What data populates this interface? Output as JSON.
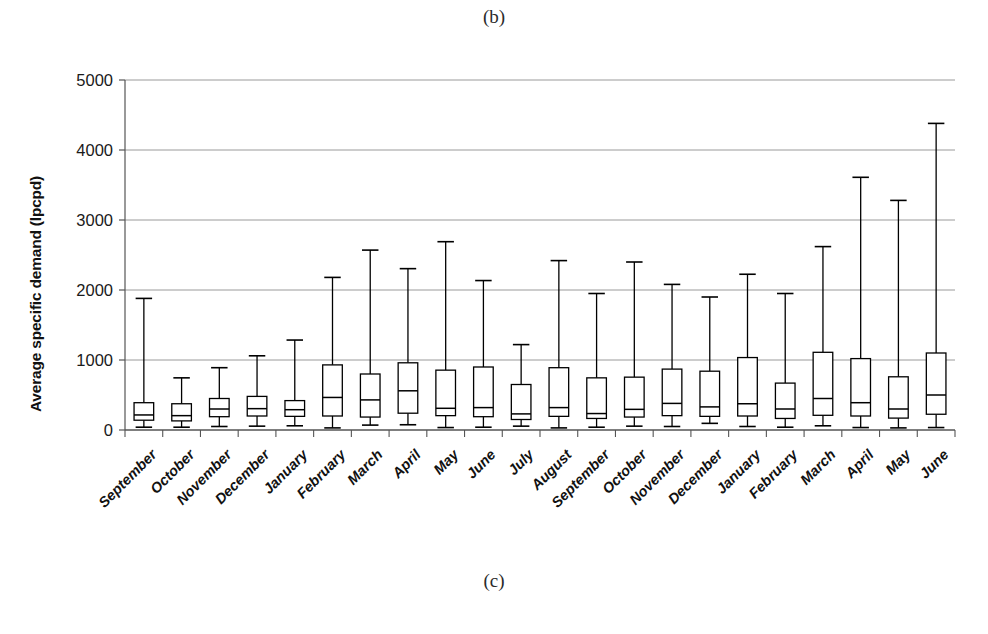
{
  "figure": {
    "caption_top": "(b)",
    "caption_bottom": "(c)"
  },
  "chart_data": {
    "type": "box",
    "title": "",
    "subtitle": "",
    "xlabel": "",
    "ylabel": "Average specific demand (lpcpd)",
    "ylim": [
      0,
      5000
    ],
    "ytick_labels": [
      "0",
      "1000",
      "2000",
      "3000",
      "4000",
      "5000"
    ],
    "yticks": [
      0,
      1000,
      2000,
      3000,
      4000,
      5000
    ],
    "grid": "horizontal",
    "legend": "none",
    "units": "lpcpd",
    "box_fill": "#ffffff",
    "box_stroke": "#000000",
    "grid_color": "#9a9a9a",
    "categories": [
      "September",
      "October",
      "November",
      "December",
      "January",
      "February",
      "March",
      "April",
      "May",
      "June",
      "July",
      "August",
      "September",
      "October",
      "November",
      "December",
      "January",
      "February",
      "March",
      "April",
      "May",
      "June"
    ],
    "boxes": [
      {
        "category": "September",
        "min": 40,
        "q1": 140,
        "median": 215,
        "q3": 390,
        "max": 1880
      },
      {
        "category": "October",
        "min": 40,
        "q1": 130,
        "median": 205,
        "q3": 375,
        "max": 745
      },
      {
        "category": "November",
        "min": 50,
        "q1": 190,
        "median": 300,
        "q3": 450,
        "max": 890
      },
      {
        "category": "December",
        "min": 55,
        "q1": 200,
        "median": 305,
        "q3": 480,
        "max": 1060
      },
      {
        "category": "January",
        "min": 60,
        "q1": 195,
        "median": 290,
        "q3": 420,
        "max": 1285
      },
      {
        "category": "February",
        "min": 30,
        "q1": 200,
        "median": 465,
        "q3": 930,
        "max": 2180
      },
      {
        "category": "March",
        "min": 70,
        "q1": 185,
        "median": 430,
        "q3": 800,
        "max": 2570
      },
      {
        "category": "April",
        "min": 75,
        "q1": 240,
        "median": 560,
        "q3": 960,
        "max": 2305
      },
      {
        "category": "May",
        "min": 35,
        "q1": 205,
        "median": 310,
        "q3": 855,
        "max": 2690
      },
      {
        "category": "June",
        "min": 40,
        "q1": 190,
        "median": 320,
        "q3": 900,
        "max": 2135
      },
      {
        "category": "July",
        "min": 55,
        "q1": 150,
        "median": 230,
        "q3": 650,
        "max": 1220
      },
      {
        "category": "August",
        "min": 30,
        "q1": 195,
        "median": 320,
        "q3": 890,
        "max": 2420
      },
      {
        "category": "September",
        "min": 40,
        "q1": 165,
        "median": 235,
        "q3": 745,
        "max": 1950
      },
      {
        "category": "October",
        "min": 55,
        "q1": 185,
        "median": 295,
        "q3": 755,
        "max": 2400
      },
      {
        "category": "November",
        "min": 50,
        "q1": 205,
        "median": 380,
        "q3": 870,
        "max": 2080
      },
      {
        "category": "December",
        "min": 95,
        "q1": 195,
        "median": 330,
        "q3": 840,
        "max": 1900
      },
      {
        "category": "January",
        "min": 50,
        "q1": 200,
        "median": 375,
        "q3": 1035,
        "max": 2225
      },
      {
        "category": "February",
        "min": 40,
        "q1": 165,
        "median": 300,
        "q3": 670,
        "max": 1950
      },
      {
        "category": "March",
        "min": 60,
        "q1": 210,
        "median": 450,
        "q3": 1110,
        "max": 2620
      },
      {
        "category": "April",
        "min": 35,
        "q1": 200,
        "median": 390,
        "q3": 1020,
        "max": 3610
      },
      {
        "category": "May",
        "min": 30,
        "q1": 170,
        "median": 300,
        "q3": 760,
        "max": 3280
      },
      {
        "category": "June",
        "min": 35,
        "q1": 225,
        "median": 500,
        "q3": 1100,
        "max": 4380
      }
    ]
  }
}
